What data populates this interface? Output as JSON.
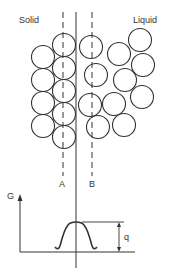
{
  "labels": {
    "solid": "Solid",
    "liquid": "Liquid",
    "plane_a": "A",
    "plane_b": "B",
    "axis_g": "G",
    "barrier": "q"
  },
  "colors": {
    "stroke": "#333333",
    "background": "#ffffff"
  },
  "atoms": {
    "radius": 11.5,
    "solid": [
      {
        "cx": 43,
        "cy": 57
      },
      {
        "cx": 43,
        "cy": 80
      },
      {
        "cx": 43,
        "cy": 103
      },
      {
        "cx": 43,
        "cy": 126
      },
      {
        "cx": 64,
        "cy": 45
      },
      {
        "cx": 64,
        "cy": 68
      },
      {
        "cx": 64,
        "cy": 91
      },
      {
        "cx": 64,
        "cy": 114
      },
      {
        "cx": 64,
        "cy": 137
      }
    ],
    "liquid": [
      {
        "cx": 91,
        "cy": 47
      },
      {
        "cx": 96,
        "cy": 75
      },
      {
        "cx": 90,
        "cy": 105
      },
      {
        "cx": 98,
        "cy": 127
      },
      {
        "cx": 119,
        "cy": 54
      },
      {
        "cx": 125,
        "cy": 80
      },
      {
        "cx": 114,
        "cy": 104
      },
      {
        "cx": 124,
        "cy": 125
      },
      {
        "cx": 140,
        "cy": 40
      },
      {
        "cx": 143,
        "cy": 65
      },
      {
        "cx": 142,
        "cy": 97
      }
    ]
  }
}
